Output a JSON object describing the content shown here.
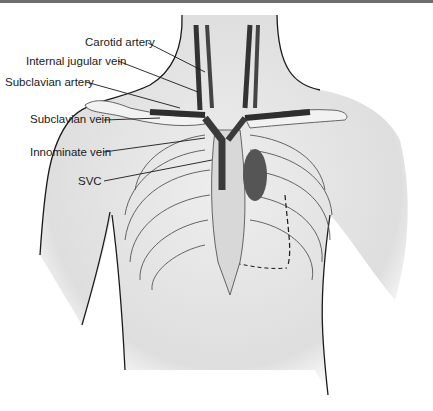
{
  "figure": {
    "labels": [
      {
        "id": "carotid",
        "text": "Carotid artery"
      },
      {
        "id": "ijv",
        "text": "Internal jugular vein"
      },
      {
        "id": "subclavian_artery",
        "text": "Subclavian artery"
      },
      {
        "id": "subclavian_vein",
        "text": "Subclavian vein"
      },
      {
        "id": "innominate",
        "text": "Innominate vein"
      },
      {
        "id": "svc",
        "text": "SVC"
      }
    ]
  },
  "colors": {
    "skin": "#e6e6e6",
    "outline": "#1a1a1a",
    "vessel_dark": "#3a3a3a",
    "bone": "#f2f2f2",
    "top_bar": "#6e6e6e"
  }
}
